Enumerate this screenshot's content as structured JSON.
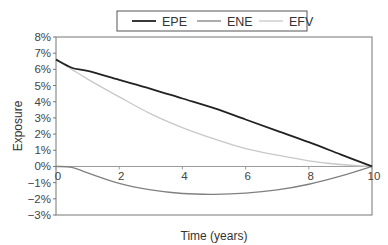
{
  "chart_data": {
    "type": "line",
    "title": "",
    "xlabel": "Time (years)",
    "ylabel": "Exposure",
    "xlim": [
      0,
      10
    ],
    "ylim": [
      -3,
      8
    ],
    "x_ticks": [
      0,
      2,
      4,
      6,
      8,
      10
    ],
    "x_tick_labels": [
      "0",
      "2",
      "4",
      "6",
      "8",
      "10"
    ],
    "y_ticks": [
      8,
      7,
      6,
      5,
      4,
      3,
      2,
      1,
      0,
      -1,
      -2,
      -3
    ],
    "y_tick_labels": [
      "8%",
      "7%",
      "6%",
      "5%",
      "4%",
      "3%",
      "2%",
      "1%",
      "0%",
      "−1%",
      "−2%",
      "−3%"
    ],
    "grid": false,
    "legend_position": "top-center",
    "x": [
      0,
      0.5,
      1,
      2,
      3,
      4,
      5,
      6,
      7,
      8,
      9,
      10
    ],
    "series": [
      {
        "name": "EPE",
        "color": "#222222",
        "width": 1.8,
        "values": [
          6.6,
          6.1,
          5.9,
          5.35,
          4.8,
          4.2,
          3.6,
          2.9,
          2.2,
          1.5,
          0.75,
          0.0
        ]
      },
      {
        "name": "ENE",
        "color": "#808080",
        "width": 1.3,
        "values": [
          0.0,
          -0.05,
          -0.4,
          -1.05,
          -1.45,
          -1.67,
          -1.72,
          -1.65,
          -1.45,
          -1.1,
          -0.6,
          0.0
        ]
      },
      {
        "name": "EFV",
        "color": "#c8c8c8",
        "width": 1.3,
        "values": [
          6.6,
          6.0,
          5.4,
          4.3,
          3.25,
          2.4,
          1.7,
          1.1,
          0.7,
          0.35,
          0.12,
          0.0
        ]
      }
    ]
  }
}
